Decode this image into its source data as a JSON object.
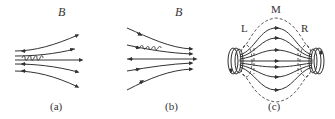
{
  "figure": {
    "panels": [
      {
        "id": "a",
        "caption": "(a)",
        "field_label": "B",
        "description": "Diverging magnetic field lines with a spiraling charged particle moving left-to-right (field lines spreading out to the right)"
      },
      {
        "id": "b",
        "caption": "(b)",
        "field_label": "B",
        "description": "Converging magnetic field lines with a spiraling charged particle moving into a stronger field region"
      },
      {
        "id": "c",
        "caption": "(c)",
        "region_labels": [
          "L",
          "M",
          "R"
        ],
        "description": "Magnetic bottle: two current coils at left and right ends, field lines bulging in the middle region M and converging at L and R, dashed particle trajectory envelope"
      }
    ],
    "colors": {
      "line": "#333333",
      "background": "#ffffff"
    }
  }
}
